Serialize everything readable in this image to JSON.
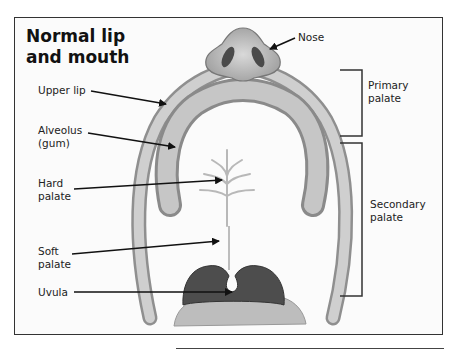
{
  "title": {
    "line1": "Normal lip",
    "line2": "and mouth"
  },
  "labels": {
    "nose": "Nose",
    "upper_lip": "Upper lip",
    "alveolus_line1": "Alveolus",
    "alveolus_line2": "(gum)",
    "hard_palate_line1": "Hard",
    "hard_palate_line2": "palate",
    "soft_palate_line1": "Soft",
    "soft_palate_line2": "palate",
    "uvula": "Uvula"
  },
  "brackets": {
    "primary_line1": "Primary",
    "primary_line2": "palate",
    "secondary_line1": "Secondary",
    "secondary_line2": "palate"
  },
  "colors": {
    "frame": "#333333",
    "tissue_light": "#c9c9c9",
    "tissue_mid": "#9a9a9a",
    "tissue_dark": "#4a4a4a",
    "arrow": "#111111"
  }
}
